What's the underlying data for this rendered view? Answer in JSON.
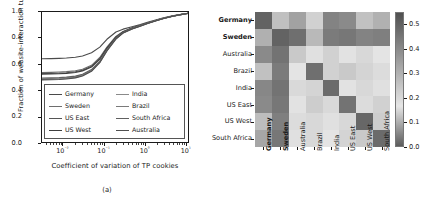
{
  "figure": {
    "captions": {
      "a": "(a)",
      "b": "(b)"
    }
  },
  "chart_data": [
    {
      "type": "line",
      "panel": "a",
      "title": "",
      "xlabel": "Coefficient of variation of TP cookies",
      "ylabel": "Fraction of website-interaction tuples",
      "xscale": "log",
      "xlim": [
        0.003,
        12
      ],
      "ylim": [
        0.0,
        1.0
      ],
      "grid": false,
      "xticks": [
        "10⁻²",
        "10⁻¹",
        "10⁰",
        "10¹"
      ],
      "xtick_values": [
        0.01,
        0.1,
        1,
        10
      ],
      "yticks": [
        "0.0",
        "0.2",
        "0.4",
        "0.6",
        "0.8",
        "1.0"
      ],
      "ytick_values": [
        0.0,
        0.2,
        0.4,
        0.6,
        0.8,
        1.0
      ],
      "legend_position": "lower-left-inside",
      "legend_columns": 2,
      "x": [
        0.003,
        0.005,
        0.008,
        0.012,
        0.02,
        0.03,
        0.05,
        0.08,
        0.12,
        0.2,
        0.3,
        0.5,
        0.8,
        1.2,
        2,
        3,
        5,
        8,
        12
      ],
      "series": [
        {
          "name": "Germany",
          "color": "#4a4a4a",
          "values": [
            0.64,
            0.641,
            0.643,
            0.646,
            0.652,
            0.662,
            0.686,
            0.73,
            0.79,
            0.846,
            0.868,
            0.886,
            0.903,
            0.92,
            0.94,
            0.955,
            0.97,
            0.982,
            0.99
          ]
        },
        {
          "name": "Sweden",
          "color": "#6e6e6e",
          "values": [
            0.535,
            0.536,
            0.538,
            0.541,
            0.548,
            0.56,
            0.59,
            0.65,
            0.73,
            0.812,
            0.85,
            0.878,
            0.898,
            0.916,
            0.937,
            0.953,
            0.969,
            0.981,
            0.99
          ]
        },
        {
          "name": "US East",
          "color": "#555555",
          "values": [
            0.527,
            0.528,
            0.53,
            0.533,
            0.54,
            0.552,
            0.582,
            0.642,
            0.724,
            0.808,
            0.848,
            0.876,
            0.897,
            0.915,
            0.936,
            0.952,
            0.968,
            0.981,
            0.99
          ]
        },
        {
          "name": "US West",
          "color": "#3f3f3f",
          "values": [
            0.522,
            0.523,
            0.525,
            0.528,
            0.535,
            0.547,
            0.577,
            0.637,
            0.72,
            0.805,
            0.846,
            0.875,
            0.896,
            0.914,
            0.936,
            0.952,
            0.968,
            0.981,
            0.99
          ]
        },
        {
          "name": "India",
          "color": "#8a8a8a",
          "values": [
            0.487,
            0.488,
            0.49,
            0.494,
            0.502,
            0.516,
            0.552,
            0.618,
            0.706,
            0.796,
            0.84,
            0.871,
            0.893,
            0.912,
            0.934,
            0.951,
            0.967,
            0.98,
            0.99
          ]
        },
        {
          "name": "Brazil",
          "color": "#7a7a7a",
          "values": [
            0.482,
            0.483,
            0.485,
            0.489,
            0.497,
            0.512,
            0.548,
            0.614,
            0.703,
            0.794,
            0.839,
            0.87,
            0.892,
            0.911,
            0.934,
            0.951,
            0.967,
            0.98,
            0.99
          ]
        },
        {
          "name": "South Africa",
          "color": "#606060",
          "values": [
            0.492,
            0.493,
            0.495,
            0.499,
            0.507,
            0.521,
            0.557,
            0.622,
            0.709,
            0.798,
            0.842,
            0.872,
            0.894,
            0.913,
            0.935,
            0.951,
            0.967,
            0.98,
            0.99
          ]
        },
        {
          "name": "Australia",
          "color": "#505050",
          "values": [
            0.478,
            0.479,
            0.481,
            0.485,
            0.493,
            0.508,
            0.544,
            0.61,
            0.7,
            0.792,
            0.838,
            0.869,
            0.891,
            0.911,
            0.933,
            0.95,
            0.967,
            0.98,
            0.99
          ]
        }
      ]
    },
    {
      "type": "heatmap",
      "panel": "b",
      "title": "",
      "xlabel": "",
      "ylabel": "",
      "colorbar": {
        "ticks": [
          "0.5",
          "0.4",
          "0.3",
          "0.2",
          "0.1",
          "0.0"
        ],
        "tick_values": [
          0.5,
          0.4,
          0.3,
          0.2,
          0.1,
          0.0
        ],
        "vmin": 0.0,
        "vmax": 0.55
      },
      "bold_labels": [
        "Germany",
        "Sweden"
      ],
      "row_labels": [
        "Germany",
        "Sweden",
        "Australia",
        "Brazil",
        "India",
        "US East",
        "US West",
        "South Africa"
      ],
      "col_labels": [
        "Germany",
        "Sweden",
        "Australia",
        "Brazil",
        "India",
        "US East",
        "US West",
        "South Africa"
      ],
      "values": [
        [
          0.5,
          0.12,
          0.34,
          0.22,
          0.42,
          0.4,
          0.26,
          0.3
        ],
        [
          0.1,
          0.5,
          0.47,
          0.28,
          0.44,
          0.45,
          0.42,
          0.43
        ],
        [
          0.4,
          0.46,
          0.24,
          0.18,
          0.14,
          0.16,
          0.2,
          0.17
        ],
        [
          0.26,
          0.44,
          0.17,
          0.47,
          0.22,
          0.24,
          0.21,
          0.19
        ],
        [
          0.41,
          0.46,
          0.15,
          0.21,
          0.48,
          0.16,
          0.2,
          0.18
        ],
        [
          0.4,
          0.45,
          0.16,
          0.23,
          0.15,
          0.46,
          0.19,
          0.22
        ],
        [
          0.27,
          0.43,
          0.19,
          0.2,
          0.18,
          0.2,
          0.49,
          0.23
        ],
        [
          0.33,
          0.45,
          0.18,
          0.2,
          0.17,
          0.21,
          0.24,
          0.48
        ]
      ]
    }
  ]
}
